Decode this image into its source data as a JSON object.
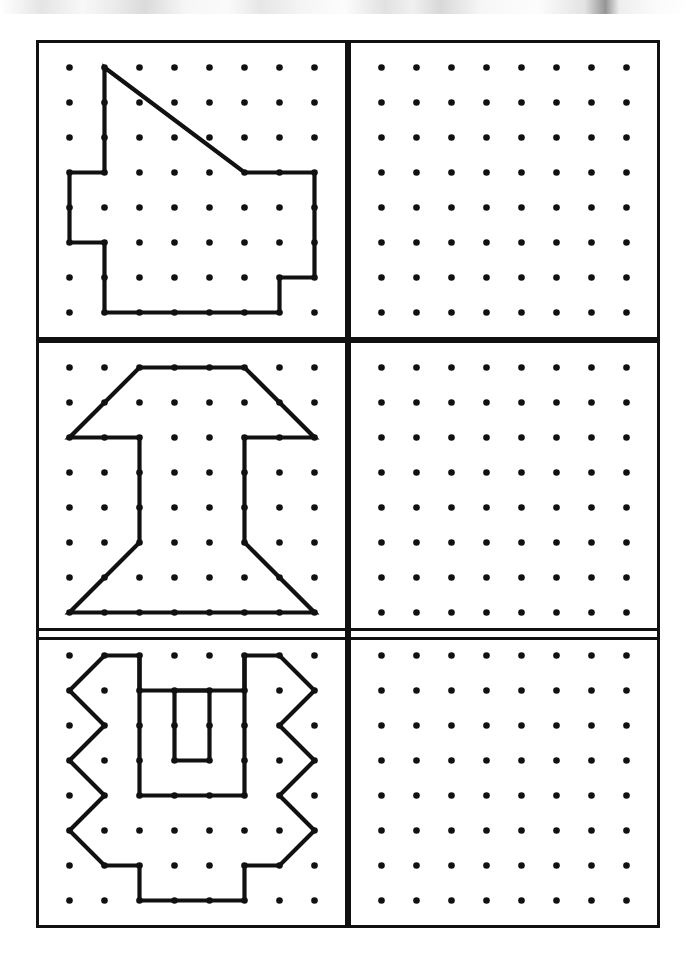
{
  "document": {
    "title": "Geoboard Copy-the-Shape Worksheet",
    "description": "Three rows; each row has a completed dot-grid figure on the left and an empty dot grid on the right for copying.",
    "page_background": "#ffffff",
    "ink_color": "#111111"
  },
  "scan_artifact": {
    "name": "top-scan-strip",
    "visible": true,
    "height_px": 14
  },
  "geoboard": {
    "grid_columns": 8,
    "grid_rows": 8,
    "dot_spacing_px": 35,
    "dot_radius_px": 3.3,
    "dot_color": "#111111",
    "panel_stroke_px": 3,
    "shape_stroke_px": 4.2
  },
  "layout": {
    "panel_width_px": 312,
    "panel_height_px": 300,
    "left_panel_x": 36,
    "right_panel_x": 348,
    "row_tops": [
      26,
      326,
      614
    ],
    "divider_x": 348
  },
  "rows": [
    {
      "row_label": "row-1",
      "left": {
        "name": "geoboard-figure-1",
        "caption": "House-like polygon with diagonal roof",
        "filled": true,
        "polygon": [
          [
            1,
            0
          ],
          [
            5,
            3
          ],
          [
            7,
            3
          ],
          [
            7,
            6
          ],
          [
            6,
            6
          ],
          [
            6,
            7
          ],
          [
            1,
            7
          ],
          [
            1,
            5
          ],
          [
            0,
            5
          ],
          [
            0,
            3
          ],
          [
            1,
            3
          ]
        ]
      },
      "right": {
        "name": "geoboard-blank-1",
        "caption": "Empty grid",
        "filled": false
      }
    },
    {
      "row_label": "row-2",
      "left": {
        "name": "geoboard-figure-2",
        "caption": "I-beam / dumbbell with chamfered trapezoid ends",
        "filled": true,
        "polygon": [
          [
            2,
            0
          ],
          [
            5,
            0
          ],
          [
            7,
            2
          ],
          [
            5,
            2
          ],
          [
            5,
            5
          ],
          [
            7,
            7
          ],
          [
            0,
            7
          ],
          [
            2,
            5
          ],
          [
            2,
            2
          ],
          [
            0,
            2
          ]
        ]
      },
      "right": {
        "name": "geoboard-blank-2",
        "caption": "Empty grid",
        "filled": false
      }
    },
    {
      "row_label": "row-3",
      "left": {
        "name": "geoboard-figure-3",
        "caption": "Zigzag-sided frame with inner U channel and a hole",
        "filled": true,
        "outline": [
          [
            1,
            0
          ],
          [
            2,
            0
          ],
          [
            2,
            1
          ],
          [
            5,
            1
          ],
          [
            5,
            0
          ],
          [
            6,
            0
          ],
          [
            7,
            1
          ],
          [
            6,
            2
          ],
          [
            7,
            3
          ],
          [
            6,
            4
          ],
          [
            7,
            5
          ],
          [
            6,
            6
          ],
          [
            5,
            6
          ],
          [
            5,
            7
          ],
          [
            2,
            7
          ],
          [
            2,
            6
          ],
          [
            1,
            6
          ],
          [
            0,
            5
          ],
          [
            1,
            4
          ],
          [
            0,
            3
          ],
          [
            1,
            2
          ],
          [
            0,
            1
          ]
        ],
        "inner_u": [
          [
            2,
            0
          ],
          [
            2,
            4
          ],
          [
            5,
            4
          ],
          [
            5,
            0
          ]
        ],
        "hole": [
          [
            3,
            1
          ],
          [
            4,
            1
          ],
          [
            4,
            3
          ],
          [
            3,
            3
          ]
        ]
      },
      "right": {
        "name": "geoboard-blank-3",
        "caption": "Empty grid",
        "filled": false
      }
    }
  ]
}
